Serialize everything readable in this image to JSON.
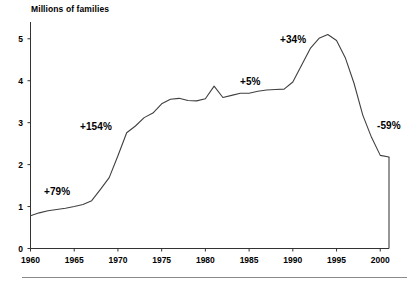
{
  "chart": {
    "title": "Millions of families",
    "ylabel": "",
    "xlabel": ""
  },
  "annotations": [
    {
      "text": "+79%",
      "x": 44,
      "y": 186
    },
    {
      "text": "+154%",
      "x": 80,
      "y": 121
    },
    {
      "text": "+5%",
      "x": 240,
      "y": 76
    },
    {
      "text": "+34%",
      "x": 280,
      "y": 34
    },
    {
      "text": "-59%",
      "x": 377,
      "y": 120
    }
  ],
  "chart_data": {
    "type": "line",
    "title": "Millions of families",
    "xlabel": "",
    "ylabel": "Millions of families",
    "xlim": [
      1960,
      2001
    ],
    "ylim": [
      0,
      5.4
    ],
    "yticks": [
      0,
      1,
      2,
      3,
      4,
      5
    ],
    "xticks": [
      1960,
      1965,
      1970,
      1975,
      1980,
      1985,
      1990,
      1995,
      2000
    ],
    "ytick_labels": [
      "0",
      "1",
      "2",
      "3",
      "4",
      "5"
    ],
    "xtick_labels": [
      "1960",
      "1965",
      "1970",
      "1975",
      "1980",
      "1985",
      "1990",
      "1995",
      "2000"
    ],
    "grid": false,
    "legend": null,
    "series": [
      {
        "name": "Families receiving AFDC",
        "x": [
          1960,
          1961,
          1962,
          1963,
          1964,
          1965,
          1966,
          1967,
          1968,
          1969,
          1970,
          1971,
          1972,
          1973,
          1974,
          1975,
          1976,
          1977,
          1978,
          1979,
          1980,
          1981,
          1982,
          1983,
          1984,
          1985,
          1986,
          1987,
          1988,
          1989,
          1990,
          1991,
          1992,
          1993,
          1994,
          1995,
          1996,
          1997,
          1998,
          1999,
          2000,
          2001
        ],
        "values": [
          0.78,
          0.85,
          0.9,
          0.93,
          0.96,
          1.0,
          1.05,
          1.14,
          1.41,
          1.69,
          2.21,
          2.76,
          2.92,
          3.12,
          3.23,
          3.45,
          3.56,
          3.58,
          3.53,
          3.52,
          3.57,
          3.87,
          3.6,
          3.65,
          3.7,
          3.7,
          3.75,
          3.78,
          3.79,
          3.8,
          3.97,
          4.37,
          4.77,
          5.01,
          5.1,
          4.96,
          4.55,
          3.94,
          3.18,
          2.65,
          2.22,
          2.18
        ]
      }
    ],
    "annotations": [
      {
        "label": "+79%",
        "period": "1960-1967",
        "value": 79
      },
      {
        "label": "+154%",
        "period": "1967-1971",
        "value": 154
      },
      {
        "label": "+5%",
        "period": "1975-1989",
        "value": 5
      },
      {
        "label": "+34%",
        "period": "1989-1994",
        "value": 34
      },
      {
        "label": "-59%",
        "period": "1994-2001",
        "value": -59
      }
    ]
  },
  "colors": {
    "line": "#404040",
    "axis": "#333333",
    "text": "#000000",
    "rule": "#8a8a8a"
  }
}
